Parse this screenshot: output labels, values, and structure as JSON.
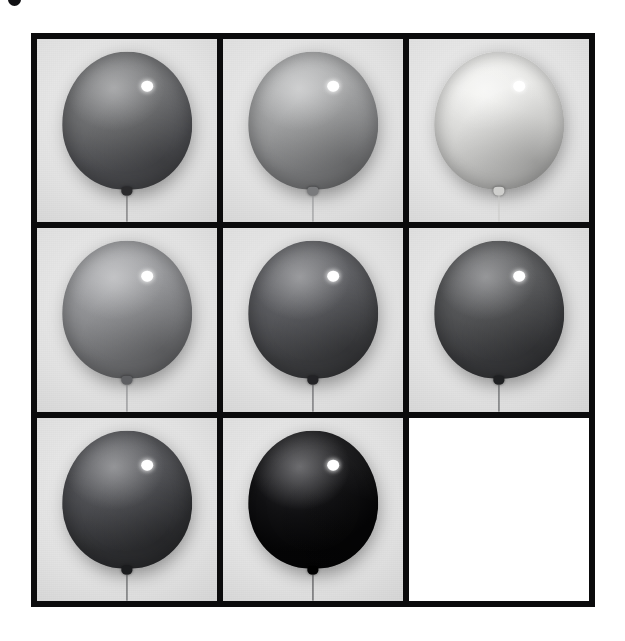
{
  "page": {
    "background_color": "#ffffff",
    "width": 625,
    "height": 641,
    "crop_mark_label": "",
    "figure_caption": ""
  },
  "grid": {
    "label": "balloon-grayscale-grid",
    "columns": 3,
    "rows": 3,
    "border_color": "#0b0b0c",
    "cell_background_color": "#dedede",
    "gap_px": 6,
    "border_px": 6
  },
  "cells": [
    {
      "index": 1,
      "row": 1,
      "column": 1,
      "name": "balloon-dark-gray",
      "empty": false,
      "balloon_color": "#6f7072",
      "balloon_color_light": "#848587",
      "balloon_color_dark": "#55565a",
      "highlight_color": "#ffffff",
      "knot_color": "#2a2a2c",
      "string_color": "#5a5a5c",
      "backdrop_color": "#dcdcdc"
    },
    {
      "index": 2,
      "row": 1,
      "column": 2,
      "name": "balloon-medium-light-gray",
      "empty": false,
      "balloon_color": "#a4a5a6",
      "balloon_color_light": "#b9babb",
      "balloon_color_dark": "#8d8e90",
      "highlight_color": "#ffffff",
      "knot_color": "#7a7b7d",
      "string_color": "#8d8e90",
      "backdrop_color": "#dcdcdc"
    },
    {
      "index": 3,
      "row": 1,
      "column": 3,
      "name": "balloon-near-white",
      "empty": false,
      "balloon_color": "#e8e8e6",
      "balloon_color_light": "#f4f4f2",
      "balloon_color_dark": "#d9d9d7",
      "highlight_color": "#ffffff",
      "knot_color": "#cfcfcd",
      "string_color": "#c8c8c6",
      "backdrop_color": "#dedede"
    },
    {
      "index": 4,
      "row": 2,
      "column": 1,
      "name": "balloon-mid-gray",
      "empty": false,
      "balloon_color": "#96979a",
      "balloon_color_light": "#a8a9ac",
      "balloon_color_dark": "#7e7f82",
      "highlight_color": "#ffffff",
      "knot_color": "#5e5f62",
      "string_color": "#7e7f82",
      "backdrop_color": "#dcdcdc"
    },
    {
      "index": 5,
      "row": 2,
      "column": 2,
      "name": "balloon-darker-gray",
      "empty": false,
      "balloon_color": "#5b5c60",
      "balloon_color_light": "#6e6f73",
      "balloon_color_dark": "#454649",
      "highlight_color": "#ffffff",
      "knot_color": "#232326",
      "string_color": "#4d4e51",
      "backdrop_color": "#dcdcdc"
    },
    {
      "index": 6,
      "row": 2,
      "column": 3,
      "name": "balloon-charcoal-gray",
      "empty": false,
      "balloon_color": "#565759",
      "balloon_color_light": "#68696c",
      "balloon_color_dark": "#414245",
      "highlight_color": "#ffffff",
      "knot_color": "#1f2022",
      "string_color": "#4a4b4e",
      "backdrop_color": "#dcdcdc"
    },
    {
      "index": 7,
      "row": 3,
      "column": 1,
      "name": "balloon-deep-gray",
      "empty": false,
      "balloon_color": "#4e4f53",
      "balloon_color_light": "#65666a",
      "balloon_color_dark": "#353639",
      "highlight_color": "#ffffff",
      "knot_color": "#1b1c1e",
      "string_color": "#46474a",
      "backdrop_color": "#dcdcdc"
    },
    {
      "index": 8,
      "row": 3,
      "column": 2,
      "name": "balloon-black",
      "empty": false,
      "balloon_color": "#121214",
      "balloon_color_light": "#2c2c30",
      "balloon_color_dark": "#060607",
      "highlight_color": "#ffffff",
      "knot_color": "#000000",
      "string_color": "#3a3a3d",
      "backdrop_color": "#dcdcdc"
    },
    {
      "index": 9,
      "row": 3,
      "column": 3,
      "name": "empty-cell",
      "empty": true,
      "balloon_color": "",
      "backdrop_color": "#ffffff"
    }
  ]
}
